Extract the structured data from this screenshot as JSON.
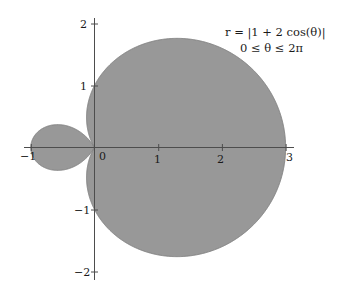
{
  "figure": {
    "background_color": "#ffffff",
    "curve_fill_color": "#989898",
    "curve_stroke_color": "#7a7a7a",
    "axis_color": "#4d4d4d",
    "text_color": "#1a1a1a"
  },
  "annotations": {
    "equation": "r = |1 + 2 cos(θ)|",
    "equation_parts": {
      "lhs": "r",
      "equals": "=",
      "rhs": "|1 + 2 cos(θ)|"
    },
    "domain": "0 ≤ θ ≤ 2π"
  },
  "axes": {
    "x_label": "",
    "y_label": "",
    "x_ticks": [
      {
        "value": -1,
        "label": "−1"
      },
      {
        "value": 0,
        "label": "0"
      },
      {
        "value": 1,
        "label": "1"
      },
      {
        "value": 2,
        "label": "2"
      },
      {
        "value": 3,
        "label": "3"
      }
    ],
    "y_ticks": [
      {
        "value": 2,
        "label": "2"
      },
      {
        "value": 1,
        "label": "1"
      },
      {
        "value": -1,
        "label": "−1"
      },
      {
        "value": -2,
        "label": "−2"
      }
    ],
    "xlim": [
      -1.15,
      3.2
    ],
    "ylim": [
      -2.25,
      2.25
    ],
    "grid": false
  },
  "chart_data": {
    "type": "line",
    "plot_kind": "polar-filled",
    "title": "",
    "xlabel": "",
    "ylabel": "",
    "equation": "r = |1 + 2 cos(θ)|",
    "theta_min": 0,
    "theta_max": 6.283185307179586,
    "theta_label_min": "0",
    "theta_label_max": "2π",
    "xlim": [
      -1.15,
      3.2
    ],
    "ylim": [
      -2.25,
      2.25
    ],
    "grid": false,
    "legend": null,
    "filled": true,
    "fill_color": "#989898",
    "features": {
      "max_r": 3,
      "max_r_at_theta": 0,
      "inner_loop_min_x": -1,
      "outer_loop_max_x": 3,
      "zeros_at_theta": [
        2.0943951023931953,
        4.1887902047863905
      ]
    },
    "samples_theta_deg": [
      0,
      15,
      30,
      45,
      60,
      75,
      90,
      105,
      120,
      135,
      150,
      165,
      180,
      195,
      210,
      225,
      240,
      255,
      270,
      285,
      300,
      315,
      330,
      345,
      360
    ],
    "samples_r": [
      3.0,
      2.932,
      2.732,
      2.414,
      2.0,
      1.518,
      1.0,
      0.482,
      0.0,
      0.414,
      0.732,
      0.932,
      1.0,
      0.932,
      0.732,
      0.414,
      0.0,
      0.482,
      1.0,
      1.518,
      2.0,
      2.414,
      2.732,
      2.932,
      3.0
    ]
  }
}
